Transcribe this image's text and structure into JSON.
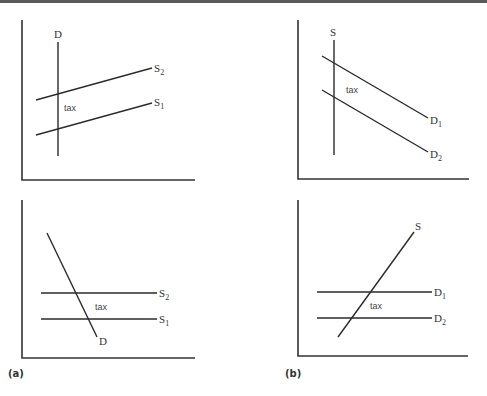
{
  "figure": {
    "panel_labels": {
      "a": "(a)",
      "b": "(b)"
    },
    "tax_label": "tax",
    "panels": {
      "a_top": {
        "curves": [
          {
            "name": "D",
            "sub": ""
          },
          {
            "name": "S",
            "sub": "2"
          },
          {
            "name": "S",
            "sub": "1"
          }
        ]
      },
      "b_top": {
        "curves": [
          {
            "name": "S",
            "sub": ""
          },
          {
            "name": "D",
            "sub": "1"
          },
          {
            "name": "D",
            "sub": "2"
          }
        ]
      },
      "a_bottom": {
        "curves": [
          {
            "name": "S",
            "sub": "2"
          },
          {
            "name": "S",
            "sub": "1"
          },
          {
            "name": "D",
            "sub": ""
          }
        ]
      },
      "b_bottom": {
        "curves": [
          {
            "name": "S",
            "sub": ""
          },
          {
            "name": "D",
            "sub": "1"
          },
          {
            "name": "D",
            "sub": "2"
          }
        ]
      }
    }
  },
  "colors": {
    "line": "#2a2a2a",
    "axis": "#333333",
    "topbar": "#5a5a5a"
  }
}
